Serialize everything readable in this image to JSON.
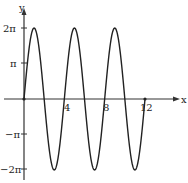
{
  "chart_data": {
    "type": "line",
    "title": "",
    "xlabel": "x",
    "ylabel": "y",
    "function": "y = 2π·sin(πx/2)",
    "xlim": [
      0,
      12
    ],
    "ylim": [
      -6.283,
      6.283
    ],
    "x_ticks": [
      4,
      8,
      12
    ],
    "x_tick_labels": [
      "4",
      "8",
      "12"
    ],
    "y_ticks": [
      6.283,
      3.1416,
      -3.1416,
      -6.283
    ],
    "y_tick_labels": [
      "2π",
      "π",
      "−π",
      "−2π"
    ],
    "grid": false,
    "legend": null,
    "series": [
      {
        "name": "curve",
        "x": [
          0,
          1,
          2,
          3,
          4,
          5,
          6,
          7,
          8,
          9,
          10,
          11,
          12
        ],
        "y": [
          0,
          6.283,
          0,
          -6.283,
          0,
          6.283,
          0,
          -6.283,
          0,
          6.283,
          0,
          -6.283,
          0
        ]
      }
    ],
    "color": "#222222"
  },
  "labels": {
    "x_axis": "x",
    "y_axis": "y",
    "t4": "4",
    "t8": "8",
    "t12": "12",
    "y2pi": "2π",
    "ypi": "π",
    "ynpi": "−π",
    "yn2pi": "−2π"
  }
}
